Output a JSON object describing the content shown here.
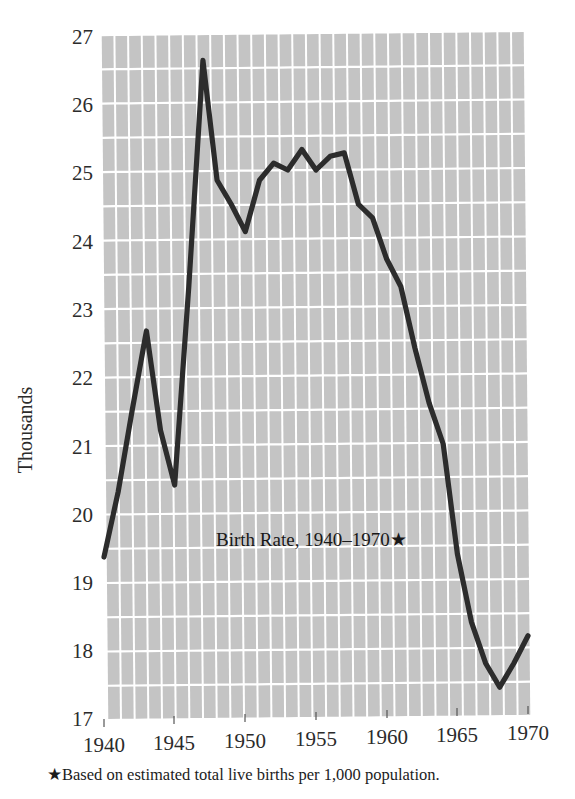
{
  "figure": {
    "title": "Birth Rate, 1940–1970★",
    "footnote": "★Based on estimated total live births per 1,000 population.",
    "y_axis_label": "Thousands"
  },
  "colors": {
    "line": "#2c2c2c",
    "grid_block": "#c4c4c4",
    "grid_line": "#ffffff",
    "text": "#1c1c1c",
    "page_background": "#ffffff"
  },
  "chart_data": {
    "type": "line",
    "title": "Birth Rate, 1940–1970★",
    "xlabel": "",
    "ylabel": "Thousands",
    "xlim": [
      1940,
      1970
    ],
    "ylim": [
      17,
      27
    ],
    "grid": true,
    "legend": "none",
    "y_ticks": [
      17,
      18,
      19,
      20,
      21,
      22,
      23,
      24,
      25,
      26,
      27
    ],
    "y_tick_labels": [
      "17",
      "18",
      "19",
      "20",
      "21",
      "22",
      "23",
      "24",
      "25",
      "26",
      "27"
    ],
    "x_ticks": [
      1940,
      1945,
      1950,
      1955,
      1960,
      1965,
      1970
    ],
    "x_tick_labels": [
      "1940",
      "1945",
      "1950",
      "1955",
      "1960",
      "1965",
      "1970"
    ],
    "annotations": [
      "★Based on estimated total live births per 1,000 population."
    ],
    "series": [
      {
        "name": "Birth Rate",
        "x": [
          1940,
          1941,
          1942,
          1943,
          1944,
          1945,
          1946,
          1947,
          1948,
          1949,
          1950,
          1951,
          1952,
          1953,
          1954,
          1955,
          1956,
          1957,
          1958,
          1959,
          1960,
          1961,
          1962,
          1963,
          1964,
          1965,
          1966,
          1967,
          1968,
          1969,
          1970
        ],
        "values": [
          19.35,
          20.3,
          21.5,
          22.65,
          21.2,
          20.4,
          23.3,
          26.6,
          24.85,
          24.5,
          24.1,
          24.85,
          25.1,
          25.0,
          25.3,
          25.0,
          25.2,
          25.25,
          24.5,
          24.3,
          23.7,
          23.3,
          22.4,
          21.6,
          21.0,
          19.4,
          18.4,
          17.8,
          17.45,
          17.8,
          18.2
        ]
      }
    ]
  },
  "plot_geometry": {
    "left": 104,
    "right": 528,
    "top": 33,
    "bottom": 718,
    "columns": 31
  }
}
